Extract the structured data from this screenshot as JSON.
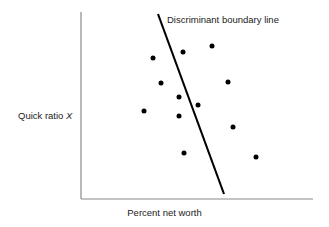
{
  "figure": {
    "background_color": "#ffffff",
    "axis_color": "#8a8a8a",
    "point_color": "#000000",
    "line_color": "#000000",
    "text_color": "#222222"
  },
  "labels": {
    "y_axis_prefix": "Quick ratio ",
    "y_axis_variable": "X",
    "x_axis": "Percent net worth",
    "annotation": "Discriminant boundary line"
  },
  "chart_data": {
    "type": "scatter",
    "title": "",
    "xlabel": "Percent net worth",
    "ylabel": "Quick ratio X",
    "grid": false,
    "legend": false,
    "axis_ticks": false,
    "axes": {
      "x_start_px": 81,
      "x_end_px": 313,
      "y_top_px": 12,
      "y_bottom_px": 199
    },
    "annotations": [
      {
        "text": "Discriminant boundary line",
        "x_px": 167,
        "y_px": 20
      }
    ],
    "series": [
      {
        "name": "observations",
        "marker": "filled-circle",
        "marker_size_px": 5,
        "points_px": [
          [
            153,
            58
          ],
          [
            183,
            52
          ],
          [
            212,
            46
          ],
          [
            161,
            83
          ],
          [
            228,
            82
          ],
          [
            179,
            97
          ],
          [
            198,
            105
          ],
          [
            144,
            111
          ],
          [
            179,
            116
          ],
          [
            233,
            127
          ],
          [
            184,
            153
          ],
          [
            256,
            157
          ]
        ]
      }
    ],
    "lines": [
      {
        "name": "discriminant-boundary-line",
        "x1_px": 158,
        "y1_px": 14,
        "x2_px": 224,
        "y2_px": 194,
        "width_px": 2.1
      }
    ]
  }
}
